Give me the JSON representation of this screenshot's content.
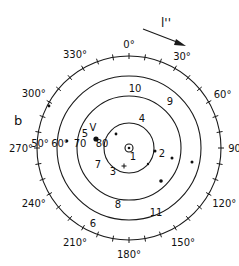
{
  "panel_label": "b",
  "arrow_label": "l''",
  "geometry": {
    "center": [
      129,
      148
    ],
    "rings": [
      25,
      52,
      72,
      92
    ],
    "stroke": "#1a1a1a"
  },
  "azimuth_labels": [
    {
      "text": "0°",
      "deg": 0,
      "r": 104
    },
    {
      "text": "30°",
      "deg": 30,
      "r": 106
    },
    {
      "text": "60°",
      "deg": 60,
      "r": 108
    },
    {
      "text": "90°",
      "deg": 90,
      "r": 108
    },
    {
      "text": "120°",
      "deg": 120,
      "r": 110
    },
    {
      "text": "150°",
      "deg": 150,
      "r": 108
    },
    {
      "text": "180°",
      "deg": 180,
      "r": 106
    },
    {
      "text": "210°",
      "deg": 210,
      "r": 108
    },
    {
      "text": "240°",
      "deg": 240,
      "r": 110
    },
    {
      "text": "270°",
      "deg": 270,
      "r": 108
    },
    {
      "text": "300°",
      "deg": 300,
      "r": 110
    },
    {
      "text": "330°",
      "deg": 330,
      "r": 108
    }
  ],
  "inclination_labels": [
    {
      "text": "50°",
      "x": 40,
      "y": 147
    },
    {
      "text": "60°",
      "x": 60,
      "y": 147
    },
    {
      "text": "70",
      "x": 80,
      "y": 147
    },
    {
      "text": "80",
      "x": 102,
      "y": 147
    }
  ],
  "site_numbers": [
    {
      "text": "1",
      "x": 133,
      "y": 160
    },
    {
      "text": "2",
      "x": 162,
      "y": 157
    },
    {
      "text": "3",
      "x": 113,
      "y": 175
    },
    {
      "text": "4",
      "x": 142,
      "y": 122
    },
    {
      "text": "5",
      "x": 85,
      "y": 137
    },
    {
      "text": "6",
      "x": 93,
      "y": 227
    },
    {
      "text": "7",
      "x": 98,
      "y": 168
    },
    {
      "text": "8",
      "x": 118,
      "y": 208
    },
    {
      "text": "9",
      "x": 170,
      "y": 105
    },
    {
      "text": "10",
      "x": 135,
      "y": 92
    },
    {
      "text": "11",
      "x": 156,
      "y": 216
    },
    {
      "text": "V",
      "x": 93,
      "y": 131
    }
  ],
  "points": [
    {
      "x": 96,
      "y": 139,
      "r": 2.6
    },
    {
      "x": 116,
      "y": 134,
      "r": 1.4
    },
    {
      "x": 155,
      "y": 151,
      "r": 1.5
    },
    {
      "x": 148,
      "y": 164,
      "r": 1.2
    },
    {
      "x": 172,
      "y": 158,
      "r": 1.5
    },
    {
      "x": 161,
      "y": 181,
      "r": 1.8
    },
    {
      "x": 192,
      "y": 162,
      "r": 1.5
    },
    {
      "x": 49,
      "y": 106,
      "r": 1.4
    },
    {
      "x": 67,
      "y": 141,
      "r": 1.3
    }
  ],
  "plus_marker": {
    "x": 124,
    "y": 166
  },
  "center_symbol": {
    "x": 129,
    "y": 148
  }
}
